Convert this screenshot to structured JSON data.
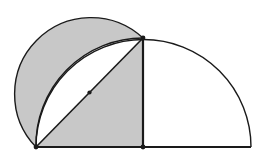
{
  "figure": {
    "title": "Semicircle with inscribed right triangle and lune",
    "type": "geometry-diagram",
    "canvas": {
      "width": 259,
      "height": 162,
      "background": "#ffffff"
    },
    "colors": {
      "shaded_fill": "#c8c8c8",
      "unshaded_fill": "#ffffff",
      "stroke": "#1a1a1a",
      "vertex_dot": "#1a1a1a"
    },
    "stroke_widths": {
      "arc": 1.4,
      "chord": 1.6,
      "baseline": 2.2,
      "vertical": 2.2
    },
    "points": [
      {
        "name": "A",
        "role": "left-endpoint-of-diameter",
        "x": 36,
        "y": 147,
        "dot": true
      },
      {
        "name": "B",
        "role": "apex-on-large-semicircle",
        "x": 143,
        "y": 38,
        "dot": true
      },
      {
        "name": "C",
        "role": "center-of-large-semicircle",
        "x": 143,
        "y": 147,
        "dot": true
      },
      {
        "name": "M",
        "role": "midpoint-of-hypotenuse",
        "x": 89.5,
        "y": 92.5,
        "dot": true
      },
      {
        "name": "D",
        "role": "right-endpoint-of-diameter",
        "x": 251,
        "y": 147,
        "dot": false
      }
    ],
    "large_semicircle": {
      "center_x": 143,
      "center_y": 147,
      "radius": 107,
      "start_x": 36,
      "start_y": 147,
      "end_x": 251,
      "end_y": 147,
      "fill": "#ffffff"
    },
    "small_semicircle": {
      "description": "semicircle on hypotenuse AB as diameter, bulging up-left",
      "center_x": 89.5,
      "center_y": 92.5,
      "radius": 76.4,
      "start_x": 36,
      "start_y": 147,
      "end_x": 143,
      "end_y": 38,
      "fill": "#c8c8c8"
    },
    "triangle": {
      "description": "right triangle A-B-C, shaded",
      "vertices": "A(36,147) B(143,38) C(143,147)",
      "fill": "#c8c8c8"
    },
    "lune": {
      "description": "white region between large arc AB and chord AB",
      "fill": "#ffffff"
    },
    "baseline": {
      "x1": 36,
      "y1": 147,
      "x2": 251,
      "y2": 147
    },
    "vertical_radius": {
      "x1": 143,
      "y1": 38,
      "x2": 143,
      "y2": 147
    },
    "hypotenuse": {
      "x1": 36,
      "y1": 147,
      "x2": 143,
      "y2": 38
    },
    "paths": {
      "shaded_small_semicircle": "M 36 147 A 76.4 76.4 0 0 1 143 38 L 36 147 Z",
      "shaded_triangle": "M 36 147 L 143 38 L 143 147 Z",
      "white_lune": "M 36 147 A 107 107 0 0 1 143 38 L 36 147 Z",
      "large_arc": "M 36 147 A 107 107 0 0 1 251 147",
      "small_arc": "M 36 147 A 76.4 76.4 0 0 1 143 38",
      "inner_large_arc": "M 36 147 A 107 107 0 0 1 143 38"
    }
  }
}
